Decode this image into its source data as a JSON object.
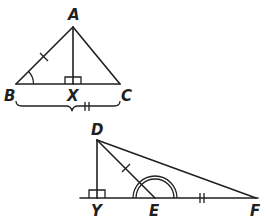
{
  "figure": {
    "colors": {
      "stroke": "#231f20",
      "background": "#ffffff"
    },
    "triangle_abc": {
      "points": {
        "A": {
          "label": "A",
          "x": 73,
          "y": 27
        },
        "B": {
          "label": "B",
          "x": 16,
          "y": 84
        },
        "C": {
          "label": "C",
          "x": 120,
          "y": 84
        },
        "X": {
          "label": "X",
          "x": 73,
          "y": 84
        }
      },
      "marks": {
        "AB": "single tick",
        "angle_B": "single arc",
        "angle_AXB": "right angle",
        "BC": "brace with double tick"
      }
    },
    "triangle_def": {
      "points": {
        "D": {
          "label": "D",
          "x": 97,
          "y": 140
        },
        "Y": {
          "label": "Y",
          "x": 97,
          "y": 198
        },
        "E": {
          "label": "E",
          "x": 155,
          "y": 198
        },
        "F": {
          "label": "F",
          "x": 255,
          "y": 198
        }
      },
      "marks": {
        "DE": "single tick",
        "EF": "double tick",
        "angle_DYE": "right angle",
        "angle_DEF": "double arc"
      }
    }
  }
}
